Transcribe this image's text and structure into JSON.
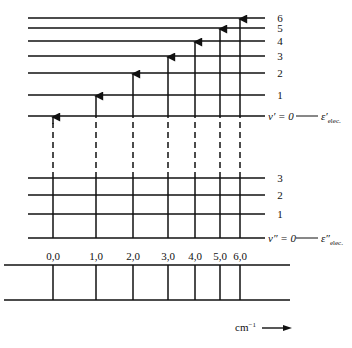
{
  "diagram": {
    "upper_state": {
      "levels": [
        {
          "v": "6",
          "y": 18
        },
        {
          "v": "5",
          "y": 28
        },
        {
          "v": "4",
          "y": 41
        },
        {
          "v": "3",
          "y": 56
        },
        {
          "v": "2",
          "y": 73
        },
        {
          "v": "1",
          "y": 95
        }
      ],
      "ground_label_v": "v′ = 0",
      "ground_y": 116,
      "electronic_label": "ε′",
      "electronic_sub": "elec."
    },
    "lower_state": {
      "levels": [
        {
          "v": "3",
          "y": 178
        },
        {
          "v": "2",
          "y": 195
        },
        {
          "v": "1",
          "y": 214
        }
      ],
      "ground_label_v": "v″ = 0",
      "ground_y": 238,
      "electronic_label": "ε″",
      "electronic_sub": "elec."
    },
    "transitions": [
      {
        "label": "0,0",
        "x": 53,
        "to_y": 116
      },
      {
        "label": "1,0",
        "x": 96,
        "to_y": 95
      },
      {
        "label": "2,0",
        "x": 133,
        "to_y": 73
      },
      {
        "label": "3,0",
        "x": 168,
        "to_y": 56
      },
      {
        "label": "4,0",
        "x": 195,
        "to_y": 41
      },
      {
        "label": "5,0",
        "x": 220,
        "to_y": 28
      },
      {
        "label": "6,0",
        "x": 240,
        "to_y": 18
      }
    ],
    "spectrum": {
      "axis_unit": "cm⁻¹",
      "arrow": "→"
    }
  }
}
